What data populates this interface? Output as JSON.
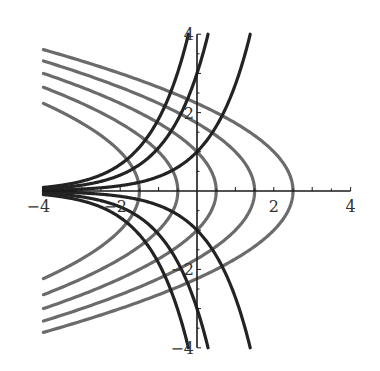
{
  "chart_data": {
    "type": "line",
    "title": "",
    "xlabel": "",
    "ylabel": "",
    "xlim": [
      -4,
      4
    ],
    "ylim": [
      -4,
      4
    ],
    "grid": false,
    "legend": null,
    "x_ticks": [
      {
        "value": -4,
        "label": "-4"
      },
      {
        "value": -2,
        "label": "-2"
      },
      {
        "value": 2,
        "label": "2"
      },
      {
        "value": 4,
        "label": "4"
      }
    ],
    "y_ticks": [
      {
        "value": 4,
        "label": "4"
      },
      {
        "value": 2,
        "label": "2"
      },
      {
        "value": -2,
        "label": "-2"
      },
      {
        "value": -4,
        "label": "-4"
      }
    ],
    "minor_tick_step": 0.5,
    "series": [
      {
        "name": "parabola a=-1.5",
        "family": "x = a - y^2/2",
        "a": -1.5,
        "color": "#6b6b6b"
      },
      {
        "name": "parabola a=-0.5",
        "family": "x = a - y^2/2",
        "a": -0.5,
        "color": "#6b6b6b"
      },
      {
        "name": "parabola a=0.5",
        "family": "x = a - y^2/2",
        "a": 0.5,
        "color": "#6b6b6b"
      },
      {
        "name": "parabola a=1.5",
        "family": "x = a - y^2/2",
        "a": 1.5,
        "color": "#6b6b6b"
      },
      {
        "name": "parabola a=2.5",
        "family": "x = a - y^2/2",
        "a": 2.5,
        "color": "#6b6b6b"
      },
      {
        "name": "exponential c=1",
        "family": "y = c e^x",
        "c": 1,
        "color": "#232323"
      },
      {
        "name": "exponential c=3",
        "family": "y = c e^x",
        "c": 3,
        "color": "#232323"
      },
      {
        "name": "exponential c=5",
        "family": "y = c e^x",
        "c": 5,
        "color": "#232323"
      },
      {
        "name": "exponential c=-1",
        "family": "y = c e^x",
        "c": -1,
        "color": "#232323"
      },
      {
        "name": "exponential c=-3",
        "family": "y = c e^x",
        "c": -3,
        "color": "#232323"
      },
      {
        "name": "exponential c=-5",
        "family": "y = c e^x",
        "c": -5,
        "color": "#232323"
      }
    ],
    "layout": {
      "origin_px": [
        197,
        191
      ],
      "px_per_unit_x": 38.4,
      "px_per_unit_y": 39.2
    }
  }
}
